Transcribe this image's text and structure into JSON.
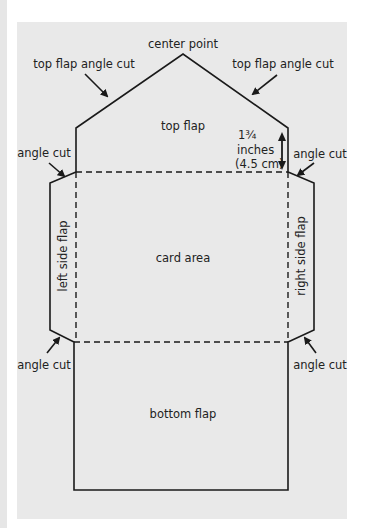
{
  "diagram": {
    "labels": {
      "center_point": "center point",
      "top_flap_angle_cut_left": "top flap angle cut",
      "top_flap_angle_cut_right": "top flap angle cut",
      "top_flap": "top flap",
      "measurement_line1": "1¾",
      "measurement_line2": "inches",
      "measurement_line3": "(4.5 cm)",
      "angle_cut_upper_left": "angle cut",
      "angle_cut_upper_right": "angle cut",
      "angle_cut_lower_left": "angle cut",
      "angle_cut_lower_right": "angle cut",
      "left_side_flap": "left side flap",
      "right_side_flap": "right side flap",
      "card_area": "card area",
      "bottom_flap": "bottom flap"
    },
    "colors": {
      "panel": "#e9e9e9",
      "line": "#1a1a1a",
      "text": "#222222"
    }
  }
}
